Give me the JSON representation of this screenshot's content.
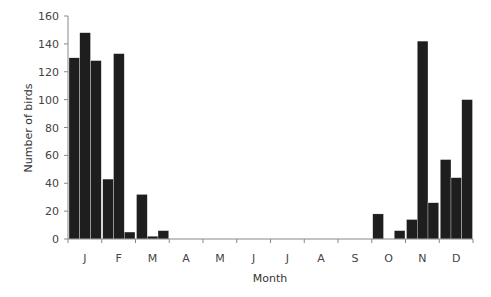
{
  "chart_data": {
    "type": "bar",
    "title": "",
    "xlabel": "Month",
    "ylabel": "Number of birds",
    "ylim": [
      0,
      160
    ],
    "yticks": [
      0,
      20,
      40,
      60,
      80,
      100,
      120,
      140,
      160
    ],
    "grid": false,
    "legend": null,
    "categories": [
      "J",
      "F",
      "M",
      "A",
      "M",
      "J",
      "J",
      "A",
      "S",
      "O",
      "N",
      "D"
    ],
    "bars_per_category": 3,
    "series": [
      {
        "name": "Period 1",
        "values": [
          130,
          43,
          32,
          0,
          0,
          0,
          0,
          0,
          0,
          18,
          14,
          57
        ]
      },
      {
        "name": "Period 2",
        "values": [
          148,
          133,
          2,
          0,
          0,
          0,
          0,
          0,
          0,
          0,
          142,
          44
        ]
      },
      {
        "name": "Period 3",
        "values": [
          128,
          5,
          6,
          0,
          0,
          0,
          0,
          0,
          0,
          6,
          26,
          100
        ]
      }
    ],
    "bar_color": "#1e1e1e"
  },
  "axes": {
    "x_title": "Month",
    "y_title": "Number of birds"
  }
}
